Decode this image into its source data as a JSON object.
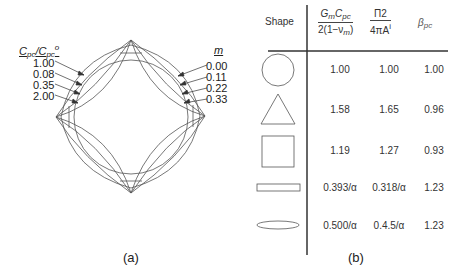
{
  "panel_a": {
    "caption": "(a)",
    "left_legend": {
      "title_main": "C",
      "title_sub": "pc",
      "title_div": "/C",
      "title_sub2": "pc",
      "title_sup": "o",
      "values": [
        "1.00",
        "0.08",
        "0.35",
        "2.00"
      ]
    },
    "right_legend": {
      "title": "m",
      "values": [
        "0.00",
        "0.11",
        "0.22",
        "0.33"
      ]
    }
  },
  "panel_b": {
    "caption": "(b)",
    "headers": {
      "shape": "Shape",
      "col1_num_main": "G",
      "col1_num_sub": "m",
      "col1_num_main2": "C",
      "col1_num_sub2": "pc",
      "col1_den": "2(1−ν",
      "col1_den_sub": "m",
      "col1_den_end": ")",
      "col2_num": "Π2",
      "col2_den": "4πA",
      "col2_den_sup": "i",
      "col3_main": "β",
      "col3_sub": "pc"
    },
    "rows": [
      {
        "shape": "circle",
        "v1": "1.00",
        "v2": "1.00",
        "v3": "1.00"
      },
      {
        "shape": "triangle",
        "v1": "1.58",
        "v2": "1.65",
        "v3": "0.96"
      },
      {
        "shape": "square",
        "v1": "1.19",
        "v2": "1.27",
        "v3": "0.93"
      },
      {
        "shape": "rectangle",
        "v1": "0.393/α",
        "v2": "0.318/α",
        "v3": "1.23"
      },
      {
        "shape": "ellipse",
        "v1": "0.500/α",
        "v2": "0.4.5/α",
        "v3": "1.23"
      }
    ]
  }
}
